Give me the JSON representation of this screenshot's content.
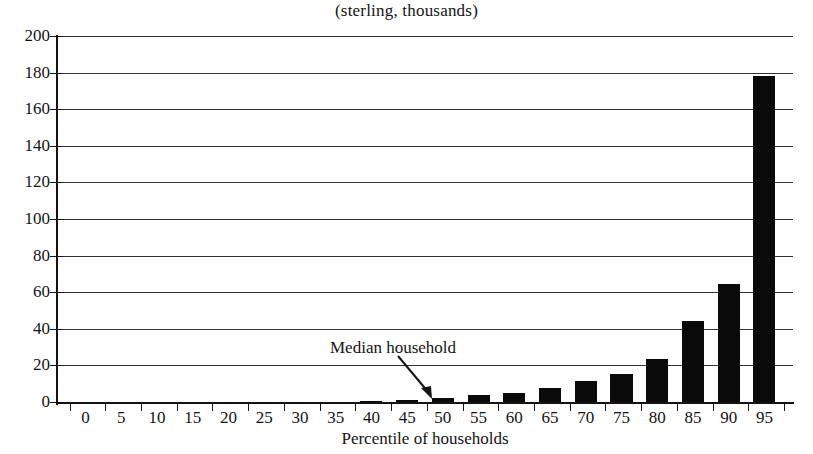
{
  "chart_data": {
    "type": "bar",
    "title": "(sterling, thousands)",
    "xlabel": "Percentile of households",
    "ylabel": "",
    "categories": [
      0,
      5,
      10,
      15,
      20,
      25,
      30,
      35,
      40,
      45,
      50,
      55,
      60,
      65,
      70,
      75,
      80,
      85,
      90,
      95
    ],
    "values": [
      0,
      0,
      0,
      0,
      0,
      0,
      0,
      0,
      0.8,
      1.2,
      2,
      4,
      5,
      7.5,
      11.5,
      15.5,
      23.5,
      44,
      64.5,
      178
    ],
    "xlim": [
      0,
      100
    ],
    "ylim": [
      0,
      200
    ],
    "y_ticks": [
      0,
      20,
      40,
      60,
      80,
      100,
      120,
      140,
      160,
      180,
      200
    ],
    "x_ticks": [
      0,
      5,
      10,
      15,
      20,
      25,
      30,
      35,
      40,
      45,
      50,
      55,
      60,
      65,
      70,
      75,
      80,
      85,
      90,
      95
    ],
    "grid": true,
    "legend": "none",
    "bar_color": "#0a0a0a",
    "axis_color": "#131313",
    "grid_color": "#32322f",
    "annotations": [
      {
        "text": "Median household",
        "points_to_category": 50,
        "arrow": "down-right"
      }
    ]
  },
  "axis": {
    "y_tick_labels": [
      "200",
      "180",
      "160",
      "140",
      "120",
      "100",
      "80",
      "60",
      "40",
      "20",
      "0"
    ],
    "x_tick_labels": [
      "0",
      "5",
      "10",
      "15",
      "20",
      "25",
      "30",
      "35",
      "40",
      "45",
      "50",
      "55",
      "60",
      "65",
      "70",
      "75",
      "80",
      "85",
      "90",
      "95"
    ]
  }
}
